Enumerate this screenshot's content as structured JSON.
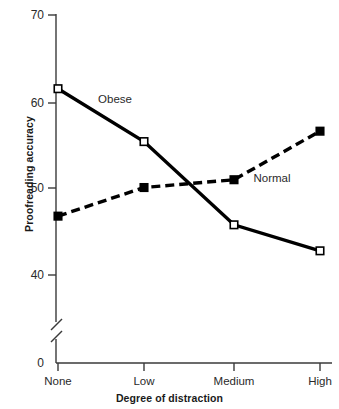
{
  "chart_data": {
    "type": "line",
    "title": "",
    "xlabel": "Degree of distraction",
    "ylabel": "Proofreading accuracy",
    "categories": [
      "None",
      "Low",
      "Medium",
      "High"
    ],
    "yticks": [
      0,
      40,
      50,
      60,
      70
    ],
    "ytick_labels": [
      "0",
      "40",
      "50",
      "60",
      "70"
    ],
    "ylim": [
      40,
      70
    ],
    "axis_break": true,
    "axis_break_note": "y-axis broken between 0 and 40",
    "grid": false,
    "legend_position": "inline-annotations",
    "series": [
      {
        "name": "Obese",
        "marker": "open-square",
        "line_style": "solid",
        "color": "#000000",
        "values": [
          61.5,
          55.4,
          45.8,
          42.8
        ],
        "label_x": 115,
        "label_y": 103
      },
      {
        "name": "Normal",
        "marker": "filled-square",
        "line_style": "dashed",
        "color": "#000000",
        "values": [
          46.8,
          50.1,
          51.0,
          56.6
        ],
        "label_x": 272,
        "label_y": 180
      }
    ],
    "annotations": [
      {
        "text": "Obese",
        "series": "Obese"
      },
      {
        "text": "Normal",
        "series": "Normal"
      }
    ]
  },
  "axis": {
    "y_tick_70": "70",
    "y_tick_60": "60",
    "y_tick_50": "50",
    "y_tick_40": "40",
    "y_tick_0": "0",
    "cat_none": "None",
    "cat_low": "Low",
    "cat_medium": "Medium",
    "cat_high": "High"
  },
  "labels": {
    "y_axis_title": "Proofreading accuracy",
    "x_axis_title": "Degree of distraction",
    "series_obese": "Obese",
    "series_normal": "Normal"
  }
}
